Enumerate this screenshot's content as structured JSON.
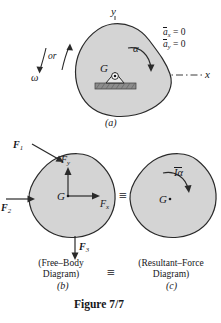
{
  "figure": {
    "caption": "Figure 7/7",
    "panels": [
      {
        "id": "a",
        "label": "(a)",
        "axis_y": "y",
        "axis_x": "x",
        "center_label": "G",
        "angular_accel": "α",
        "angular_velocity": "ω",
        "or_text": "or",
        "conditions": [
          {
            "symbol": "a",
            "sub": "x",
            "value": "= 0"
          },
          {
            "symbol": "a",
            "sub": "y",
            "value": "= 0"
          }
        ]
      },
      {
        "id": "b",
        "label": "(b)",
        "title_line1": "(Free–Body",
        "title_line2": "Diagram)",
        "center_label": "G",
        "forces": [
          {
            "name": "F",
            "sub": "1"
          },
          {
            "name": "F",
            "sub": "2"
          },
          {
            "name": "F",
            "sub": "3"
          },
          {
            "name": "F",
            "sub": "x"
          },
          {
            "name": "F",
            "sub": "y"
          }
        ]
      },
      {
        "id": "c",
        "label": "(c)",
        "title_line1": "(Resultant–Force",
        "title_line2": "Diagram)",
        "center_label": "G",
        "moment": "Iα"
      }
    ],
    "equivalence_symbol": "≡",
    "colors": {
      "body_fill": "#d4d4d4",
      "body_stroke": "#2a2a2a",
      "ink": "#16161a",
      "support_fill": "#8c8c8c"
    }
  }
}
